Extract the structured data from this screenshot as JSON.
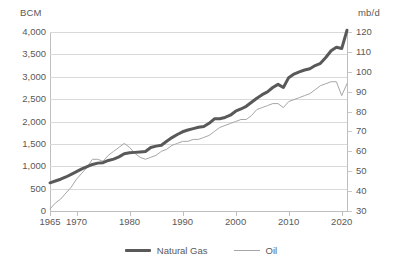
{
  "chart_data": {
    "type": "line",
    "title": "",
    "xlabel": "",
    "ylabel": "BCM",
    "y2label": "mb/d",
    "grid": true,
    "legend_position": "bottom-center",
    "xlim": [
      1965,
      2021
    ],
    "xticks": [
      "1965",
      "1970",
      "1980",
      "1990",
      "2000",
      "2010",
      "2020"
    ],
    "xtick_values": [
      1965,
      1970,
      1980,
      1990,
      2000,
      2010,
      2020
    ],
    "ylim": [
      0,
      4000
    ],
    "yticks": [
      "0",
      "500",
      "1,000",
      "1,500",
      "2,000",
      "2,500",
      "3,000",
      "3,500",
      "4,000"
    ],
    "ytick_values": [
      0,
      500,
      1000,
      1500,
      2000,
      2500,
      3000,
      3500,
      4000
    ],
    "y2lim": [
      30,
      120
    ],
    "y2ticks": [
      "30",
      "40",
      "50",
      "60",
      "70",
      "80",
      "90",
      "100",
      "110",
      "120"
    ],
    "y2tick_values": [
      30,
      40,
      50,
      60,
      70,
      80,
      90,
      100,
      110,
      120
    ],
    "x": [
      1965,
      1966,
      1967,
      1968,
      1969,
      1970,
      1971,
      1972,
      1973,
      1974,
      1975,
      1976,
      1977,
      1978,
      1979,
      1980,
      1981,
      1982,
      1983,
      1984,
      1985,
      1986,
      1987,
      1988,
      1989,
      1990,
      1991,
      1992,
      1993,
      1994,
      1995,
      1996,
      1997,
      1998,
      1999,
      2000,
      2001,
      2002,
      2003,
      2004,
      2005,
      2006,
      2007,
      2008,
      2009,
      2010,
      2011,
      2012,
      2013,
      2014,
      2015,
      2016,
      2017,
      2018,
      2019,
      2020,
      2021
    ],
    "series": [
      {
        "name": "Natural Gas",
        "axis": "left",
        "unit": "BCM",
        "color": "#595959",
        "width": 3,
        "values": [
          630,
          670,
          710,
          760,
          820,
          880,
          940,
          990,
          1040,
          1070,
          1080,
          1130,
          1160,
          1210,
          1280,
          1300,
          1310,
          1320,
          1330,
          1420,
          1450,
          1470,
          1560,
          1640,
          1710,
          1770,
          1810,
          1840,
          1870,
          1890,
          1960,
          2060,
          2060,
          2090,
          2140,
          2230,
          2280,
          2340,
          2430,
          2520,
          2600,
          2660,
          2760,
          2830,
          2760,
          2980,
          3060,
          3110,
          3150,
          3180,
          3250,
          3300,
          3430,
          3580,
          3660,
          3630,
          4040
        ]
      },
      {
        "name": "Oil",
        "axis": "right",
        "unit": "mb/d",
        "color": "#a6a6a6",
        "width": 1,
        "values": [
          31,
          34,
          36,
          39,
          42,
          46,
          49,
          52,
          56,
          56,
          55,
          58,
          60,
          62,
          64,
          62,
          59,
          57,
          56,
          57,
          58,
          60,
          61,
          63,
          64,
          65,
          65,
          66,
          66,
          67,
          68,
          70,
          72,
          73,
          74,
          75,
          76,
          76,
          78,
          81,
          82,
          83,
          84,
          84,
          82,
          85,
          86,
          87,
          88,
          89,
          91,
          93,
          94,
          95,
          95,
          88,
          94
        ]
      }
    ],
    "annotations": []
  },
  "legend": {
    "items": [
      {
        "label": "Natural Gas",
        "style": "thick-dark-line"
      },
      {
        "label": "Oil",
        "style": "thin-light-line"
      }
    ]
  },
  "colors": {
    "natural_gas": "#595959",
    "oil": "#a6a6a6",
    "gridline": "#d9d9d9",
    "axis": "#bfbfbf",
    "text": "#595959",
    "background": "#ffffff"
  }
}
